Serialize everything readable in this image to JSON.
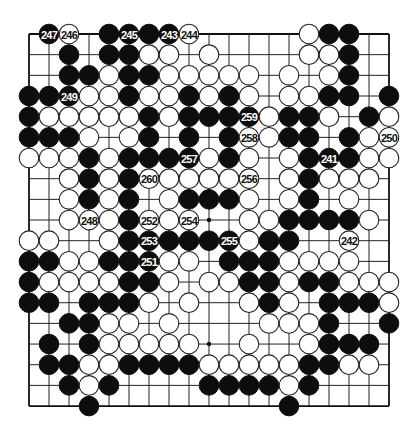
{
  "board": {
    "size": 19,
    "origin_x": 29,
    "origin_y": 34,
    "step_x": 20,
    "step_y": 20.67,
    "stone_radius": 9.8,
    "hoshi": [
      [
        3,
        3
      ],
      [
        3,
        9
      ],
      [
        3,
        15
      ],
      [
        9,
        3
      ],
      [
        9,
        9
      ],
      [
        9,
        15
      ],
      [
        15,
        3
      ],
      [
        15,
        9
      ],
      [
        15,
        15
      ]
    ],
    "colors": {
      "black": "#0d0d0d",
      "white": "#ffffff",
      "line": "#222222"
    }
  },
  "rows": [
    ".BW.BBBBW.....WBB..",
    "..B.BBWW.W....WWB..",
    "..BBWBBWWWWW.W.WB..",
    "BBBWWBWWBWBW.WWBB.B",
    "BWWWWWBWBBBBWBBW.BW",
    "BBBW.WB.B.BWWBB.BWW",
    "WWWBWBBBBWBW.WBBBWW",
    "..WBWBWWWWWW.WBWWW.",
    "..WBWB.WBBBW.WB.W..",
    "..WWWBWWW..WWBBBBW.",
    "WW..WBBBBBBWBB..W..",
    "BBWWBBBWW.BBBWWWW..",
    "BWWWWBBW.WWBBWBBWWW",
    "BB.BBBW.W..WBW.BBBW",
    "..BBWW.W....WWWB..B",
    ".B.BWWWWW..W..WBBB.",
    ".BBWWBBBBWWWWWBBWW.",
    "..BWB....BBBBWB....",
    "...B.........B....."
  ],
  "numbered_moves": [
    {
      "number": "241",
      "col": 15,
      "row": 6,
      "color": "B"
    },
    {
      "number": "242",
      "col": 16,
      "row": 10,
      "color": "W"
    },
    {
      "number": "243",
      "col": 7,
      "row": 0,
      "color": "B"
    },
    {
      "number": "244",
      "col": 8,
      "row": 0,
      "color": "W"
    },
    {
      "number": "245",
      "col": 5,
      "row": 0,
      "color": "B"
    },
    {
      "number": "246",
      "col": 2,
      "row": 0,
      "color": "W"
    },
    {
      "number": "247",
      "col": 1,
      "row": 0,
      "color": "B"
    },
    {
      "number": "248",
      "col": 3,
      "row": 9,
      "color": "W"
    },
    {
      "number": "249",
      "col": 2,
      "row": 3,
      "color": "B"
    },
    {
      "number": "250",
      "col": 18,
      "row": 5,
      "color": "W"
    },
    {
      "number": "251",
      "col": 6,
      "row": 11,
      "color": "B"
    },
    {
      "number": "252",
      "col": 6,
      "row": 9,
      "color": "W"
    },
    {
      "number": "253",
      "col": 6,
      "row": 10,
      "color": "B"
    },
    {
      "number": "254",
      "col": 8,
      "row": 9,
      "color": "W"
    },
    {
      "number": "255",
      "col": 10,
      "row": 10,
      "color": "B"
    },
    {
      "number": "256",
      "col": 11,
      "row": 7,
      "color": "W"
    },
    {
      "number": "257",
      "col": 8,
      "row": 6,
      "color": "B"
    },
    {
      "number": "258",
      "col": 11,
      "row": 5,
      "color": "W"
    },
    {
      "number": "259",
      "col": 11,
      "row": 4,
      "color": "B"
    },
    {
      "number": "260",
      "col": 6,
      "row": 7,
      "color": "W"
    }
  ]
}
